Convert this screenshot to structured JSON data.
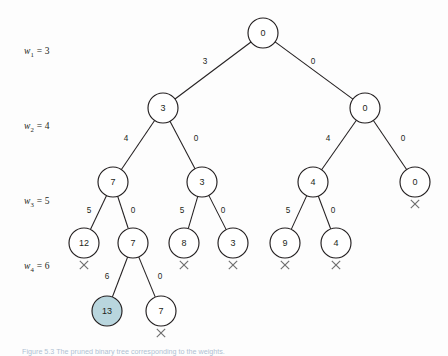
{
  "figure": {
    "caption": "Figure 5.3   The pruned binary tree corresponding to the weights.",
    "background_color": "#fdfdfd",
    "line_color": "#231f20",
    "highlight_color": "#b9d6de",
    "cross_color": "#6d6d6d",
    "caption_color": "#6f8fb0"
  },
  "weight_labels": [
    {
      "name": "w1",
      "symbol": "w",
      "subscript": "1",
      "equals": "=",
      "value": "3",
      "text": "w1 = 3",
      "x": 24,
      "y": 46
    },
    {
      "name": "w2",
      "symbol": "w",
      "subscript": "2",
      "equals": "=",
      "value": "4",
      "text": "w2 = 4",
      "x": 24,
      "y": 121
    },
    {
      "name": "w3",
      "symbol": "w",
      "subscript": "3",
      "equals": "=",
      "value": "5",
      "text": "w3 = 5",
      "x": 24,
      "y": 196
    },
    {
      "name": "w4",
      "symbol": "w",
      "subscript": "4",
      "equals": "=",
      "value": "6",
      "text": "w4 = 6",
      "x": 24,
      "y": 261
    }
  ],
  "tree": {
    "radius": 15,
    "nodes": [
      {
        "id": "root",
        "label": "0",
        "cx": 263,
        "cy": 33,
        "highlight": false,
        "cross": false
      },
      {
        "id": "n-l",
        "label": "3",
        "cx": 163,
        "cy": 108,
        "highlight": false,
        "cross": false
      },
      {
        "id": "n-r",
        "label": "0",
        "cx": 365,
        "cy": 108,
        "highlight": false,
        "cross": false
      },
      {
        "id": "n-ll",
        "label": "7",
        "cx": 113,
        "cy": 182,
        "highlight": false,
        "cross": false
      },
      {
        "id": "n-lr",
        "label": "3",
        "cx": 202,
        "cy": 182,
        "highlight": false,
        "cross": false
      },
      {
        "id": "n-rl",
        "label": "4",
        "cx": 313,
        "cy": 182,
        "highlight": false,
        "cross": false
      },
      {
        "id": "n-rr",
        "label": "0",
        "cx": 415,
        "cy": 182,
        "highlight": false,
        "cross": true
      },
      {
        "id": "n-lll",
        "label": "12",
        "cx": 84,
        "cy": 243,
        "highlight": false,
        "cross": true
      },
      {
        "id": "n-llr",
        "label": "7",
        "cx": 133,
        "cy": 243,
        "highlight": false,
        "cross": false
      },
      {
        "id": "n-lrl",
        "label": "8",
        "cx": 184,
        "cy": 243,
        "highlight": false,
        "cross": true
      },
      {
        "id": "n-lrr",
        "label": "3",
        "cx": 233,
        "cy": 243,
        "highlight": false,
        "cross": true
      },
      {
        "id": "n-rll",
        "label": "9",
        "cx": 285,
        "cy": 243,
        "highlight": false,
        "cross": true
      },
      {
        "id": "n-rlr",
        "label": "4",
        "cx": 336,
        "cy": 243,
        "highlight": false,
        "cross": true
      },
      {
        "id": "n-llrl",
        "label": "13",
        "cx": 107,
        "cy": 311,
        "highlight": true,
        "cross": false
      },
      {
        "id": "n-llrr",
        "label": "7",
        "cx": 161,
        "cy": 311,
        "highlight": false,
        "cross": true
      }
    ],
    "edges": [
      {
        "id": "e-root-l",
        "from": "root",
        "to": "n-l",
        "label": "3",
        "lx": 205,
        "ly": 62
      },
      {
        "id": "e-root-r",
        "from": "root",
        "to": "n-r",
        "label": "0",
        "lx": 313,
        "ly": 62
      },
      {
        "id": "e-l-ll",
        "from": "n-l",
        "to": "n-ll",
        "label": "4",
        "lx": 126,
        "ly": 139
      },
      {
        "id": "e-l-lr",
        "from": "n-l",
        "to": "n-lr",
        "label": "0",
        "lx": 196,
        "ly": 139
      },
      {
        "id": "e-r-rl",
        "from": "n-r",
        "to": "n-rl",
        "label": "4",
        "lx": 328,
        "ly": 139
      },
      {
        "id": "e-r-rr",
        "from": "n-r",
        "to": "n-rr",
        "label": "0",
        "lx": 403,
        "ly": 139
      },
      {
        "id": "e-ll-lll",
        "from": "n-ll",
        "to": "n-lll",
        "label": "5",
        "lx": 89,
        "ly": 211
      },
      {
        "id": "e-ll-llr",
        "from": "n-ll",
        "to": "n-llr",
        "label": "0",
        "lx": 133,
        "ly": 211
      },
      {
        "id": "e-lr-lrl",
        "from": "n-lr",
        "to": "n-lrl",
        "label": "5",
        "lx": 182,
        "ly": 211
      },
      {
        "id": "e-lr-lrr",
        "from": "n-lr",
        "to": "n-lrr",
        "label": "0",
        "lx": 223,
        "ly": 211
      },
      {
        "id": "e-rl-rll",
        "from": "n-rl",
        "to": "n-rll",
        "label": "5",
        "lx": 288,
        "ly": 211
      },
      {
        "id": "e-rl-rlr",
        "from": "n-rl",
        "to": "n-rlr",
        "label": "0",
        "lx": 333,
        "ly": 211
      },
      {
        "id": "e-llr-llrl",
        "from": "n-llr",
        "to": "n-llrl",
        "label": "6",
        "lx": 107,
        "ly": 277
      },
      {
        "id": "e-llr-llrr",
        "from": "n-llr",
        "to": "n-llrr",
        "label": "0",
        "lx": 160,
        "ly": 277
      }
    ]
  }
}
